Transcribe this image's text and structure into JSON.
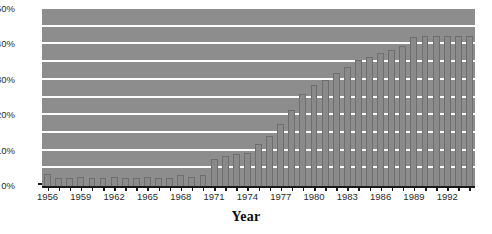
{
  "chart_data": {
    "type": "bar",
    "title": "",
    "xlabel": "Year",
    "ylabel": "",
    "ylim": [
      0,
      50
    ],
    "ytick_step": 10,
    "grid_step": 5,
    "grid": true,
    "legend": "none",
    "bar_color": "#8a8a8a",
    "plot_background": "#8d8d8d",
    "gridline_color": "#fdfdfd",
    "axis_color": "#1a1a1a",
    "ytick_labels": [
      "0%",
      "10%",
      "20%",
      "30%",
      "40%",
      "50%"
    ],
    "ytick_values": [
      0,
      10,
      20,
      30,
      40,
      50
    ],
    "xtick_labels": [
      "1956",
      "1959",
      "1962",
      "1965",
      "1968",
      "1971",
      "1974",
      "1977",
      "1980",
      "1983",
      "1986",
      "1989",
      "1992"
    ],
    "xtick_years": [
      1956,
      1959,
      1962,
      1965,
      1968,
      1971,
      1974,
      1977,
      1980,
      1983,
      1986,
      1989,
      1992
    ],
    "categories": [
      1956,
      1957,
      1958,
      1959,
      1960,
      1961,
      1962,
      1963,
      1964,
      1965,
      1966,
      1967,
      1968,
      1969,
      1970,
      1971,
      1972,
      1973,
      1974,
      1975,
      1976,
      1977,
      1978,
      1979,
      1980,
      1981,
      1982,
      1983,
      1984,
      1985,
      1986,
      1987,
      1988,
      1989,
      1990,
      1991,
      1992,
      1993,
      1994
    ],
    "values": [
      3.3,
      2.2,
      2.3,
      2.6,
      2.3,
      2.2,
      2.5,
      2.2,
      2.3,
      2.6,
      2.3,
      2.4,
      3.0,
      2.6,
      3.2,
      7.5,
      8.6,
      9.0,
      9.2,
      12.0,
      14.0,
      17.5,
      21.5,
      26.0,
      28.5,
      30.0,
      32.0,
      33.5,
      35.5,
      36.5,
      37.5,
      38.5,
      39.5,
      42.0,
      42.3,
      42.3,
      42.5,
      42.5,
      42.5
    ]
  },
  "axis": {
    "x_title": "Year"
  }
}
